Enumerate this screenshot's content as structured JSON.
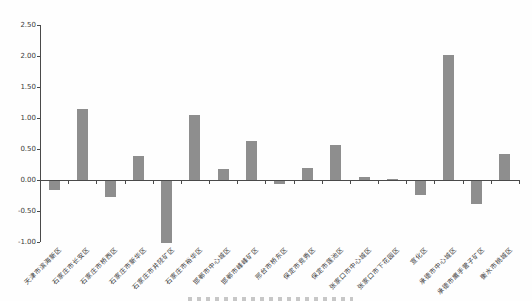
{
  "chart_data": {
    "type": "bar",
    "categories": [
      "天津市滨海新区",
      "石家庄市长安区",
      "石家庄市桥西区",
      "石家庄市新华区",
      "石家庄市井陉矿区",
      "石家庄市裕华区",
      "邯郸市中心城区",
      "邯郸市峰峰矿区",
      "邢台市桥东区",
      "保定市竞秀区",
      "保定市莲池区",
      "张家口市中心城区",
      "张家口市下花园区",
      "宣化区",
      "承德市中心城区",
      "承德市鹰手营子矿区",
      "衡水市桃城区"
    ],
    "values": [
      -0.15,
      1.15,
      -0.25,
      0.38,
      -1.0,
      1.05,
      0.17,
      0.63,
      -0.05,
      0.2,
      0.57,
      0.05,
      0.01,
      -0.22,
      2.02,
      -0.37,
      0.42
    ],
    "title": "",
    "xlabel": "",
    "ylabel": "",
    "ylim": [
      -1.0,
      2.5
    ],
    "ytick_step": 0.5,
    "ytick_labels": [
      "2.50",
      "2.00",
      "1.50",
      "1.00",
      "0.50",
      "0.00",
      "-0.50",
      "-1.00"
    ],
    "bar_color": "#8e8e8e",
    "axis_color": "#4a4a4a",
    "grid": false,
    "legend_position": "none"
  }
}
